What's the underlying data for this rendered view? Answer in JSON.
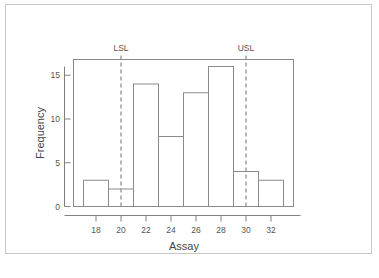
{
  "chart_data": {
    "type": "bar",
    "title": "",
    "subtitle": "",
    "xlabel": "Assay",
    "ylabel": "Frequency",
    "categories": [
      18,
      20,
      22,
      24,
      26,
      28,
      30,
      32
    ],
    "values": [
      3,
      2,
      14,
      8,
      13,
      16,
      4,
      3
    ],
    "bin_edges": [
      17,
      19,
      21,
      23,
      25,
      27,
      29,
      31,
      33
    ],
    "bin_width": 2,
    "xlim": [
      16.2,
      33.8
    ],
    "ylim": [
      0,
      16.8
    ],
    "xticks": [
      18,
      20,
      22,
      24,
      26,
      28,
      30,
      32
    ],
    "yticks": [
      0,
      5,
      10,
      15
    ],
    "xtick_labels": [
      "18",
      "20",
      "22",
      "24",
      "26",
      "28",
      "30",
      "32"
    ],
    "ytick_labels": [
      "0",
      "5",
      "10",
      "15"
    ],
    "grid": false,
    "legend": false,
    "annotations": [
      {
        "label": "LSL",
        "x": 20,
        "style": "dashed-vertical"
      },
      {
        "label": "USL",
        "x": 30,
        "style": "dashed-vertical"
      }
    ],
    "bar_fill": "#ffffff",
    "bar_stroke": "#8a8a8a",
    "spec_line_color": "#888888"
  },
  "figure": {
    "border_color": "#c8c8c8"
  },
  "caption": {
    "text": ""
  }
}
